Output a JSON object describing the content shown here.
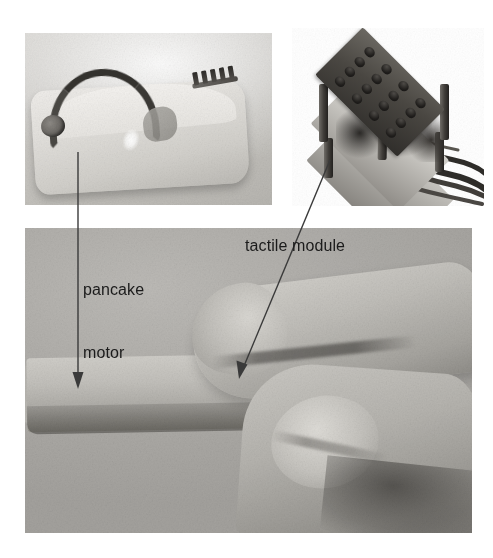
{
  "figure": {
    "background_color": "#ffffff",
    "panels": [
      {
        "name": "pancake-motor-photo",
        "caption_role": "closeup of the stylus shell with the pancake motor and pin connector",
        "background_color": "#cbc9c5"
      },
      {
        "name": "tactile-module-photo",
        "caption_role": "closeup of the stacked tactile module with a 4x4 pin array and trailing wires",
        "background_color": "#ffffff"
      },
      {
        "name": "hand-stylus-photo",
        "caption_role": "hand holding the haptic stylus between index finger and thumb",
        "background_color": "#aeaca8"
      }
    ]
  },
  "annotations": {
    "pancake_motor": {
      "label_line1": "pancake",
      "label_line2": "motor",
      "leader_color": "#3a3a3a",
      "leader_type": "vertical-arrow"
    },
    "tactile_module": {
      "label": "tactile module",
      "leader_color": "#3a3a3a",
      "leader_type": "diagonal-arrow"
    }
  },
  "tactile_module": {
    "pin_grid_rows": 4,
    "pin_grid_cols": 4,
    "pin_count": 16,
    "plate_count": 3
  },
  "colors": {
    "label_text": "#1b1b1b",
    "leader": "#3a3a3a",
    "page_background": "#ffffff"
  }
}
